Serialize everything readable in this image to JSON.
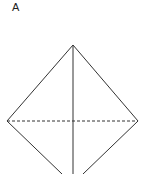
{
  "figure": {
    "label": "A",
    "shape": "diamond with vertical solid axis and horizontal dashed fold line",
    "stroke_color": "#333333",
    "vertices": {
      "top": [
        73,
        45
      ],
      "left": [
        7,
        121
      ],
      "right": [
        138,
        121
      ],
      "bottom_clipped": [
        73,
        174
      ]
    }
  }
}
